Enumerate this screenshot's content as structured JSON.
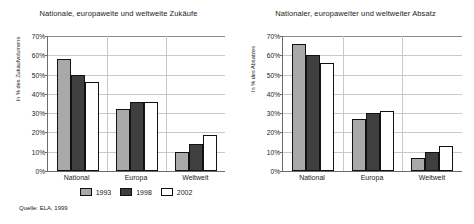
{
  "source_note": "Quelle: ELA, 1999",
  "legend": {
    "position": "bottom",
    "items": [
      {
        "label": "1993",
        "color": "#a9a9a9",
        "key": "s1993"
      },
      {
        "label": "1998",
        "color": "#3f3f3f",
        "key": "s1998"
      },
      {
        "label": "2002",
        "color": "#ffffff",
        "key": "s2002"
      }
    ]
  },
  "chart_data": [
    {
      "type": "bar",
      "title": "Nationale, europaweite und weltweite Zukäufe",
      "xlabel": "",
      "ylabel": "In % des Zukaufvolumens",
      "categories": [
        "National",
        "Europa",
        "Weltweit"
      ],
      "ylim": [
        0,
        70
      ],
      "yticks": [
        "0%",
        "10%",
        "20%",
        "30%",
        "40%",
        "50%",
        "60%",
        "70%"
      ],
      "grid": true,
      "series": [
        {
          "name": "1993",
          "values": [
            58,
            32,
            10
          ]
        },
        {
          "name": "1998",
          "values": [
            50,
            36,
            14
          ]
        },
        {
          "name": "2002",
          "values": [
            46,
            36,
            18.5
          ]
        }
      ]
    },
    {
      "type": "bar",
      "title": "Nationaler, europaweiter und weltweiter Absatz",
      "xlabel": "",
      "ylabel": "In % des Absatzes",
      "categories": [
        "National",
        "Europa",
        "Weltweit"
      ],
      "ylim": [
        0,
        70
      ],
      "yticks": [
        "0%",
        "10%",
        "20%",
        "30%",
        "40%",
        "50%",
        "60%",
        "70%"
      ],
      "grid": true,
      "series": [
        {
          "name": "1993",
          "values": [
            66,
            27,
            7
          ]
        },
        {
          "name": "1998",
          "values": [
            60,
            30,
            10
          ]
        },
        {
          "name": "2002",
          "values": [
            56,
            31,
            13
          ]
        }
      ]
    }
  ]
}
